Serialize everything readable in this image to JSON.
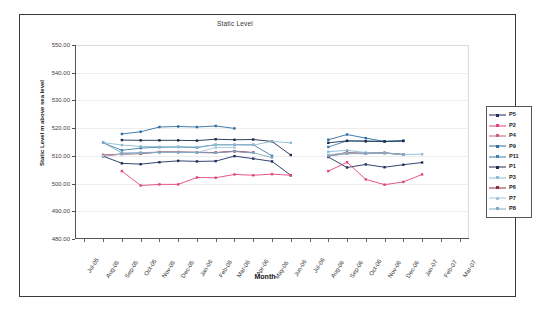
{
  "chart_data": {
    "type": "line",
    "title": "Static Level",
    "xlabel": "Month",
    "ylabel": "Static Level m above sea level",
    "ylim": [
      480.0,
      550.0
    ],
    "ytick_step": 10.0,
    "ytick_labels": [
      "550.00",
      "540.00",
      "530.00",
      "520.00",
      "510.00",
      "500.00",
      "490.00",
      "480.00"
    ],
    "ytick_values": [
      550.0,
      540.0,
      530.0,
      520.0,
      510.0,
      500.0,
      490.0,
      480.0
    ],
    "grid": true,
    "legend_position": "right",
    "categories": [
      "Jul-05",
      "Aug-05",
      "Sep-05",
      "Oct-05",
      "Nov-05",
      "Dec-05",
      "Jan-06",
      "Feb-06",
      "Mar-06",
      "Apr-06",
      "May-06",
      "Jun-06",
      "Jul-06",
      "Aug-06",
      "Sep-06",
      "Oct-06",
      "Nov-06",
      "Dec-06",
      "Jan-07",
      "Feb-07",
      "Mar-07"
    ],
    "series": [
      {
        "name": "P5",
        "color": "#1f2f5e",
        "values": [
          null,
          509.9,
          507.3,
          507.0,
          507.7,
          508.2,
          508.0,
          508.1,
          509.9,
          509.0,
          508.0,
          503.0,
          null,
          509.6,
          505.8,
          506.9,
          505.9,
          506.8,
          507.6,
          null,
          null
        ]
      },
      {
        "name": "P2",
        "color": "#e0457b",
        "values": [
          null,
          null,
          504.5,
          499.3,
          499.7,
          499.7,
          502.2,
          502.1,
          503.3,
          503.0,
          503.4,
          503.0,
          null,
          504.5,
          507.7,
          501.5,
          499.6,
          500.6,
          503.3,
          null,
          null
        ]
      },
      {
        "name": "P4",
        "color": "#c4607f",
        "values": [
          null,
          510.4,
          510.6,
          510.9,
          511.3,
          511.3,
          511.2,
          511.1,
          511.6,
          511.1,
          null,
          null,
          null,
          509.9,
          510.9,
          510.8,
          511.0,
          510.4,
          null,
          null,
          null
        ]
      },
      {
        "name": "P9",
        "color": "#2e6da4",
        "values": [
          null,
          null,
          517.9,
          518.7,
          520.4,
          520.6,
          520.4,
          520.8,
          519.9,
          null,
          null,
          null,
          null,
          515.8,
          517.7,
          516.4,
          515.2,
          515.4,
          null,
          null,
          null
        ]
      },
      {
        "name": "P11",
        "color": "#3d7fa8",
        "values": [
          null,
          514.7,
          512.0,
          512.8,
          513.1,
          513.2,
          513.0,
          514.0,
          514.0,
          514.0,
          510.0,
          null,
          null,
          513.2,
          515.4,
          515.3,
          515.2,
          515.4,
          null,
          null,
          null
        ]
      },
      {
        "name": "P1",
        "color": "#1b2a4a",
        "values": [
          null,
          null,
          515.7,
          515.6,
          515.6,
          515.6,
          515.5,
          516.0,
          515.8,
          515.9,
          515.2,
          510.3,
          null,
          514.7,
          515.4,
          515.3,
          515.2,
          515.4,
          null,
          null,
          null
        ]
      },
      {
        "name": "P3",
        "color": "#8fbcd4",
        "values": [
          null,
          514.8,
          513.9,
          513.4,
          513.3,
          513.3,
          513.2,
          514.0,
          514.0,
          513.9,
          515.2,
          514.7,
          null,
          511.5,
          512.0,
          511.2,
          511.0,
          510.5,
          510.6,
          null,
          null
        ]
      },
      {
        "name": "P6",
        "color": "#8c2f39",
        "values": [
          null,
          509.9,
          510.7,
          510.8,
          511.4,
          511.4,
          511.3,
          511.2,
          511.7,
          511.2,
          null,
          null,
          null,
          510.1,
          511.2,
          510.9,
          511.1,
          510.5,
          null,
          null,
          null
        ]
      },
      {
        "name": "P7",
        "color": "#a8c6da",
        "values": [
          null,
          510.0,
          510.6,
          511.0,
          511.2,
          511.3,
          511.2,
          513.0,
          513.0,
          null,
          null,
          null,
          null,
          510.4,
          511.0,
          510.9,
          511.0,
          510.5,
          null,
          null,
          null
        ]
      },
      {
        "name": "P8",
        "color": "#7fa9c4",
        "values": [
          null,
          514.8,
          511.0,
          511.2,
          511.3,
          511.3,
          511.2,
          511.1,
          511.6,
          511.1,
          509.4,
          null,
          null,
          510.0,
          510.8,
          510.8,
          511.0,
          510.5,
          null,
          null,
          null
        ]
      }
    ]
  },
  "legend": {
    "items": [
      {
        "label": "P5"
      },
      {
        "label": "P2"
      },
      {
        "label": "P4"
      },
      {
        "label": "P9"
      },
      {
        "label": "P11"
      },
      {
        "label": "P1"
      },
      {
        "label": "P3"
      },
      {
        "label": "P6"
      },
      {
        "label": "P7"
      },
      {
        "label": "P8"
      }
    ]
  }
}
